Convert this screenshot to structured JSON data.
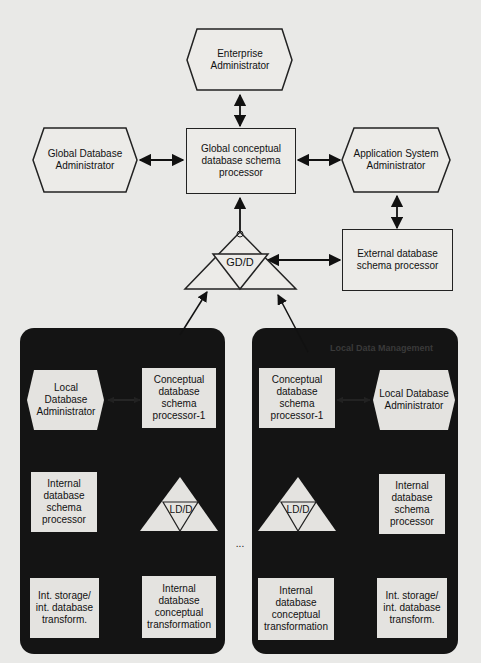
{
  "diagram": {
    "enterprise_admin": "Enterprise Administrator",
    "global_db_admin": "Global Database Administrator",
    "global_processor": "Global conceptual database schema processor",
    "app_system_admin": "Application System Administrator",
    "external_processor": "External database schema processor",
    "gdd": "GD/D",
    "ellipsis": "...",
    "left_site": {
      "header": "",
      "local_admin": "Local Database Administrator",
      "conceptual_processor": "Conceptual database schema processor-1",
      "internal_processor": "Internal database schema processor",
      "ldd": "LD/D",
      "storage_transform": "Int. storage/ int. database transform.",
      "conceptual_transform": "Internal database conceptual transformation"
    },
    "right_site": {
      "header": "Local Data Management",
      "local_admin": "Local Database Administrator",
      "conceptual_processor": "Conceptual database schema processor-1",
      "internal_processor": "Internal database schema processor",
      "ldd": "LD/D",
      "storage_transform": "Int. storage/ int. database transform.",
      "conceptual_transform": "Internal database conceptual transformation"
    }
  }
}
